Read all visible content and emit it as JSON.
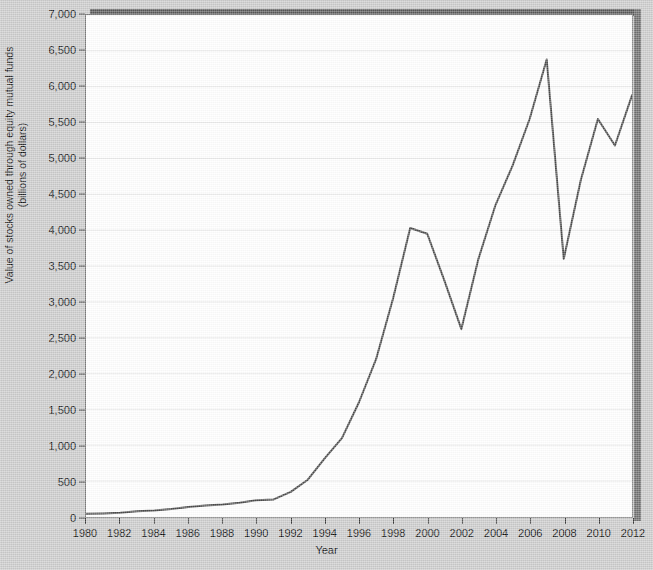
{
  "chart_data": {
    "type": "line",
    "title": "",
    "xlabel": "Year",
    "ylabel": "Value of stocks owned through equity mutual funds\n(billions of dollars)",
    "xlim": [
      1980,
      2012
    ],
    "ylim": [
      0,
      7000
    ],
    "ytick_step": 500,
    "xtick_step": 2,
    "grid": true,
    "legend": null,
    "line_color": "#4a4a4a",
    "plot_background": "#ffffff",
    "page_background": "#cbcbcb",
    "grid_color": "#e8e8e8",
    "axis_color": "#7b7b7b",
    "yticks": [
      0,
      500,
      1000,
      1500,
      2000,
      2500,
      3000,
      3500,
      4000,
      4500,
      5000,
      5500,
      6000,
      6500,
      7000
    ],
    "ytick_labels": [
      "0",
      "500",
      "1,000",
      "1,500",
      "2,000",
      "2,500",
      "3,000",
      "3,500",
      "4,000",
      "4,500",
      "5,000",
      "5,500",
      "6,000",
      "6,500",
      "7,000"
    ],
    "xticks": [
      1980,
      1982,
      1984,
      1986,
      1988,
      1990,
      1992,
      1994,
      1996,
      1998,
      2000,
      2002,
      2004,
      2006,
      2008,
      2010,
      2012
    ],
    "xtick_labels": [
      "1980",
      "1982",
      "1984",
      "1986",
      "1988",
      "1990",
      "1992",
      "1994",
      "1996",
      "1998",
      "2000",
      "2002",
      "2004",
      "2006",
      "2008",
      "2010",
      "2012"
    ],
    "x": [
      1980,
      1981,
      1982,
      1983,
      1984,
      1985,
      1986,
      1987,
      1988,
      1989,
      1990,
      1991,
      1992,
      1993,
      1994,
      1995,
      1996,
      1997,
      1998,
      1999,
      2000,
      2001,
      2002,
      2003,
      2004,
      2005,
      2006,
      2007,
      2008,
      2009,
      2010,
      2011,
      2012
    ],
    "values": [
      45,
      50,
      60,
      80,
      90,
      110,
      140,
      160,
      175,
      200,
      235,
      245,
      350,
      520,
      820,
      1100,
      1600,
      2200,
      3050,
      4030,
      3950,
      3300,
      2620,
      3600,
      4350,
      4900,
      5550,
      6380,
      3600,
      4700,
      5550,
      5180,
      5880
    ],
    "series_name": "Value of stocks owned through equity mutual funds"
  },
  "axes": {
    "y_axis_title": "Value of stocks owned through equity mutual funds\n(billions of dollars)",
    "x_axis_title": "Year"
  }
}
